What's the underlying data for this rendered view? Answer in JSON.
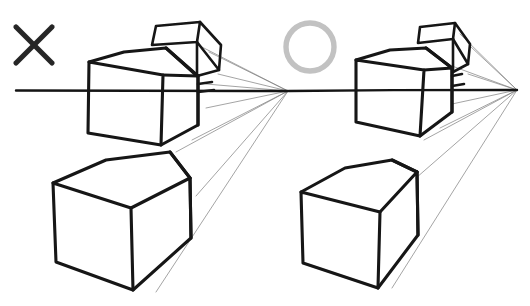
{
  "page": {
    "background_color": "#ffffff",
    "width": 530,
    "height": 306,
    "medium": "hand-drawn pen sketch"
  },
  "palette": {
    "ink": "#161616",
    "horizon_ink": "#141414",
    "guide_line": "#7c7c7c",
    "x_mark": "#262626",
    "circle_mark": "#c2c2c2",
    "paper": "#ffffff"
  },
  "panels": [
    {
      "id": "left-panel",
      "verdict_symbol": "x-mark",
      "verdict_meaning": "incorrect",
      "symbol_center": [
        34,
        45
      ],
      "symbol_size": 36,
      "vanishing_point": [
        288,
        91
      ],
      "horizon_start_x": 16,
      "horizon_end_x": 288,
      "horizon_y": 91,
      "objects": [
        {
          "name": "upper-box-with-open-flap",
          "description": "box straddling the horizon line with a raised lid flap angled back toward the vanishing point",
          "bbox": [
            88,
            26,
            222,
            145
          ]
        },
        {
          "name": "lower-box",
          "description": "large box below the horizon, receding to the vanishing point",
          "bbox": [
            52,
            150,
            200,
            290
          ]
        }
      ],
      "guide_line_count": 8
    },
    {
      "id": "right-panel",
      "verdict_symbol": "circle-mark",
      "verdict_meaning": "correct",
      "symbol_center": [
        310,
        47
      ],
      "symbol_radius": 24,
      "vanishing_point": [
        517,
        90
      ],
      "horizon_start_x": 289,
      "horizon_end_x": 517,
      "horizon_y": 90,
      "objects": [
        {
          "name": "upper-box-with-open-flap",
          "description": "box straddling the horizon line with a raised lid flap angled back toward the vanishing point",
          "bbox": [
            352,
            26,
            470,
            140
          ]
        },
        {
          "name": "lower-box",
          "description": "large cube below the horizon, receding to the vanishing point",
          "bbox": [
            300,
            155,
            425,
            285
          ]
        }
      ],
      "guide_line_count": 8
    }
  ],
  "annotations": {
    "x_label": "incorrect example",
    "circle_label": "correct example",
    "horizon_label": "horizon line",
    "vanishing_point_label": "vanishing point"
  }
}
